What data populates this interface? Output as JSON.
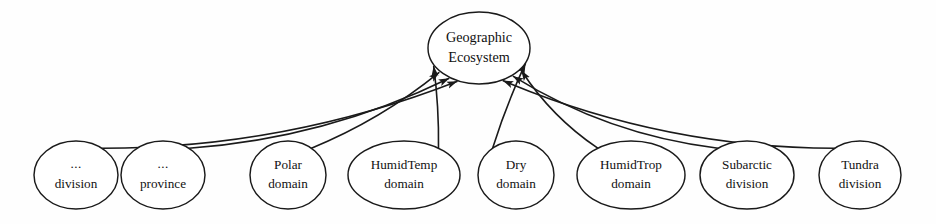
{
  "diagram": {
    "background_color": "#fefefe",
    "stroke_color": "#1a1a1a",
    "text_color": "#111111",
    "arrow_direction": "leaf-to-center",
    "center_node": {
      "id": "geographic-ecosystem",
      "line1": "Geographic",
      "line2": "Ecosystem",
      "cx": 479,
      "cy": 48,
      "rx": 51,
      "ry": 36
    },
    "leaf_nodes": [
      {
        "id": "division-generic",
        "line1": "...",
        "line2": "division",
        "cx": 76,
        "cy": 175,
        "rx": 42,
        "ry": 34,
        "exit_side": "right",
        "curve": 34
      },
      {
        "id": "province-generic",
        "line1": "...",
        "line2": "province",
        "cx": 163,
        "cy": 175,
        "rx": 42,
        "ry": 34,
        "exit_side": "right",
        "curve": 26
      },
      {
        "id": "polar-domain",
        "line1": "Polar",
        "line2": "domain",
        "cx": 288,
        "cy": 175,
        "rx": 38,
        "ry": 34,
        "exit_side": "right",
        "curve": 11
      },
      {
        "id": "humidtemp-domain",
        "line1": "HumidTemp",
        "line2": "domain",
        "cx": 404,
        "cy": 175,
        "rx": 56,
        "ry": 34,
        "exit_side": "right",
        "curve": 3
      },
      {
        "id": "dry-domain",
        "line1": "Dry",
        "line2": "domain",
        "cx": 516,
        "cy": 175,
        "rx": 38,
        "ry": 34,
        "exit_side": "left",
        "curve": 3
      },
      {
        "id": "humidtrop-domain",
        "line1": "HumidTrop",
        "line2": "domain",
        "cx": 631,
        "cy": 175,
        "rx": 54,
        "ry": 34,
        "exit_side": "left",
        "curve": 11
      },
      {
        "id": "subarctic-division",
        "line1": "Subarctic",
        "line2": "division",
        "cx": 747,
        "cy": 175,
        "rx": 47,
        "ry": 34,
        "exit_side": "left",
        "curve": 24
      },
      {
        "id": "tundra-division",
        "line1": "Tundra",
        "line2": "division",
        "cx": 860,
        "cy": 175,
        "rx": 41,
        "ry": 34,
        "exit_side": "left",
        "curve": 34
      }
    ]
  }
}
